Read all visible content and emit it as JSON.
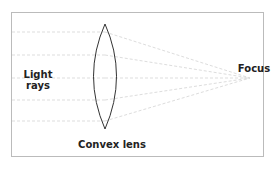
{
  "diagram": {
    "labels": {
      "light_rays_line1": "Light",
      "light_rays_line2": "rays",
      "lens": "Convex lens",
      "focus": "Focus"
    },
    "colors": {
      "frame": "#bbbbbb",
      "ray": "#dddddd",
      "lens": "#333333",
      "text": "#222222"
    },
    "rays_y": [
      32,
      55,
      78,
      100,
      121
    ],
    "focus_point": [
      250,
      78
    ]
  }
}
